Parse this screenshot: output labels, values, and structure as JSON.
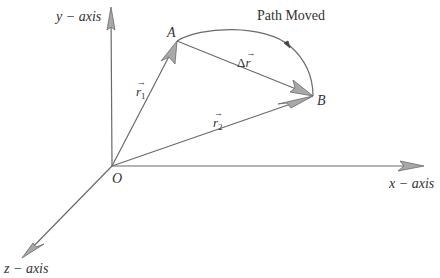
{
  "diagram": {
    "title": "Path Moved",
    "axes": {
      "y_label": "y − axis",
      "x_label": "x − axis",
      "z_label": "z − axis"
    },
    "points": {
      "origin": "O",
      "start": "A",
      "end": "B"
    },
    "vectors": {
      "r1": {
        "symbol": "r",
        "subscript": "1",
        "arrow": "→"
      },
      "r2": {
        "symbol": "r",
        "subscript": "2",
        "arrow": "→"
      },
      "delta_r": {
        "prefix": "Δ",
        "symbol": "r",
        "arrow": "→"
      }
    },
    "colors": {
      "line": "#6a6a6a",
      "arrowhead_fill": "#a8a8a8",
      "text": "#333333",
      "background": "#ffffff"
    }
  }
}
